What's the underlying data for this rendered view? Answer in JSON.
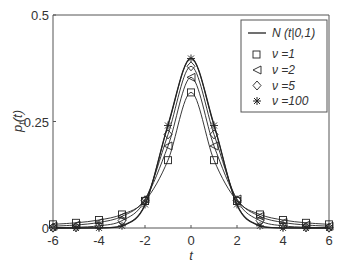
{
  "chart_data": {
    "type": "line",
    "title": "",
    "xlabel": "t",
    "ylabel": "p_t(t)",
    "xlim": [
      -6,
      6
    ],
    "ylim": [
      0,
      0.5
    ],
    "xticks": [
      -6,
      -4,
      -2,
      0,
      2,
      4,
      6
    ],
    "yticks": [
      0,
      0.25,
      0.5
    ],
    "grid": false,
    "legend_position": "upper right",
    "x": [
      -6,
      -5,
      -4,
      -3,
      -2,
      -1,
      0,
      1,
      2,
      3,
      4,
      5,
      6
    ],
    "series": [
      {
        "name": "N(t|0,1)",
        "marker": "none",
        "values": [
          0.0,
          0.0,
          0.0001,
          0.0044,
          0.054,
          0.242,
          0.3989,
          0.242,
          0.054,
          0.0044,
          0.0001,
          0.0,
          0.0
        ]
      },
      {
        "name": "ν=1",
        "marker": "square",
        "values": [
          0.0086,
          0.0122,
          0.0187,
          0.0318,
          0.0637,
          0.1592,
          0.3183,
          0.1592,
          0.0637,
          0.0318,
          0.0187,
          0.0122,
          0.0086
        ]
      },
      {
        "name": "ν=2",
        "marker": "triangle-left",
        "values": [
          0.0042,
          0.0071,
          0.013,
          0.0274,
          0.068,
          0.1925,
          0.3536,
          0.1925,
          0.068,
          0.0274,
          0.013,
          0.0071,
          0.0042
        ]
      },
      {
        "name": "ν=5",
        "marker": "diamond",
        "values": [
          0.0007,
          0.0018,
          0.0051,
          0.0173,
          0.0651,
          0.2197,
          0.3796,
          0.2197,
          0.0651,
          0.0173,
          0.0051,
          0.0018,
          0.0007
        ]
      },
      {
        "name": "ν=100",
        "marker": "star",
        "values": [
          0.0,
          0.0,
          0.0002,
          0.0051,
          0.0553,
          0.2406,
          0.3979,
          0.2406,
          0.0553,
          0.0051,
          0.0002,
          0.0,
          0.0
        ]
      }
    ]
  },
  "legend": {
    "normal": "N (t|0,1)",
    "nu1": "ν =1",
    "nu2": "ν =2",
    "nu5": "ν =5",
    "nu100": "ν =100"
  },
  "axes": {
    "xlabel": "t",
    "ylabel_main": "p",
    "ylabel_sub": "t",
    "ylabel_arg": "(t)",
    "xticks": [
      "-6",
      "-4",
      "-2",
      "0",
      "2",
      "4",
      "6"
    ],
    "yticks": [
      "0",
      "0.25",
      "0.5"
    ]
  }
}
